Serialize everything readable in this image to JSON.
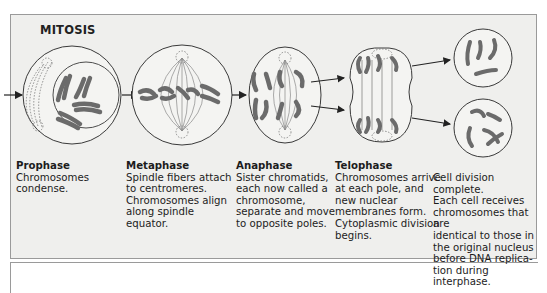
{
  "diagram": {
    "title": "MITOSIS",
    "colors": {
      "panel_bg": "#efefed",
      "border": "#9a9a9a",
      "chromosome": "#6b6b6b",
      "line": "#3a3a3a"
    },
    "stages": [
      {
        "name": "Prophase",
        "description": "Chromosomes\ncondense."
      },
      {
        "name": "Metaphase",
        "description": "Spindle fibers attach\nto centromeres.\nChromosomes align\nalong spindle\nequator."
      },
      {
        "name": "Anaphase",
        "description": "Sister chromatids,\neach now called a\nchromosome,\nseparate and move\nto opposite poles."
      },
      {
        "name": "Telophase",
        "description": "Chromosomes arrive\nat each pole, and\nnew nuclear\nmembranes form.\nCytoplasmic division\nbegins."
      },
      {
        "name": "",
        "description": "Cell division complete.\nEach cell receives\nchromosomes that are\nidentical to those in\nthe original nucleus\nbefore DNA replica-\ntion during interphase."
      }
    ]
  }
}
